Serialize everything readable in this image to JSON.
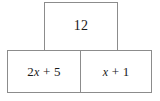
{
  "diagram": {
    "type": "bar-model",
    "background_color": "#ffffff",
    "border_color": "#8c8c8c",
    "text_color": "#1a1a1a",
    "top_box": {
      "label": "12",
      "value": "12"
    },
    "bottom_boxes": [
      {
        "label": "2x + 5",
        "coefficient": "2",
        "variable": "x",
        "operator": "+",
        "constant": "5"
      },
      {
        "label": "x + 1",
        "coefficient": "",
        "variable": "x",
        "operator": "+",
        "constant": "1"
      }
    ]
  },
  "chart_data": {
    "type": "table",
    "categories": [
      "top",
      "bottom-left",
      "bottom-right"
    ],
    "values": [
      "12",
      "2x + 5",
      "x + 1"
    ]
  }
}
